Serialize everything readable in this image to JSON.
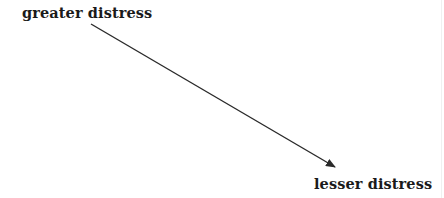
{
  "diagram": {
    "start_label": "greater distress",
    "end_label": "lesser distress",
    "arrow": {
      "from": [
        91,
        24
      ],
      "to": [
        335,
        167
      ],
      "color": "#2a2a2a",
      "direction": "start-to-end"
    }
  }
}
